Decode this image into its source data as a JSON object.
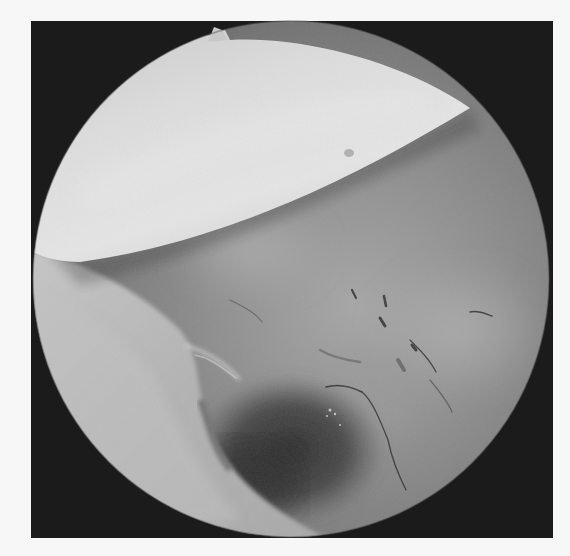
{
  "image": {
    "description": "Grayscale endoscopic view of tissue inside a circular scope field with a bright instrument edge across the upper portion",
    "colors": {
      "page_background": "#f7f7f7",
      "frame": "#1b1b1b",
      "instrument": "#d8d8d8",
      "instrument_highlight": "#ececec",
      "tissue_light": "#9a9a9a",
      "tissue_mid": "#7e7e7e",
      "tissue_dark": "#3e3e3e",
      "vessel": "#2a2a2a",
      "rim_tissue": "#b9b9b9"
    },
    "scope_view": {
      "shape": "circle",
      "center_x": 291,
      "center_y": 279,
      "radius": 260
    }
  }
}
